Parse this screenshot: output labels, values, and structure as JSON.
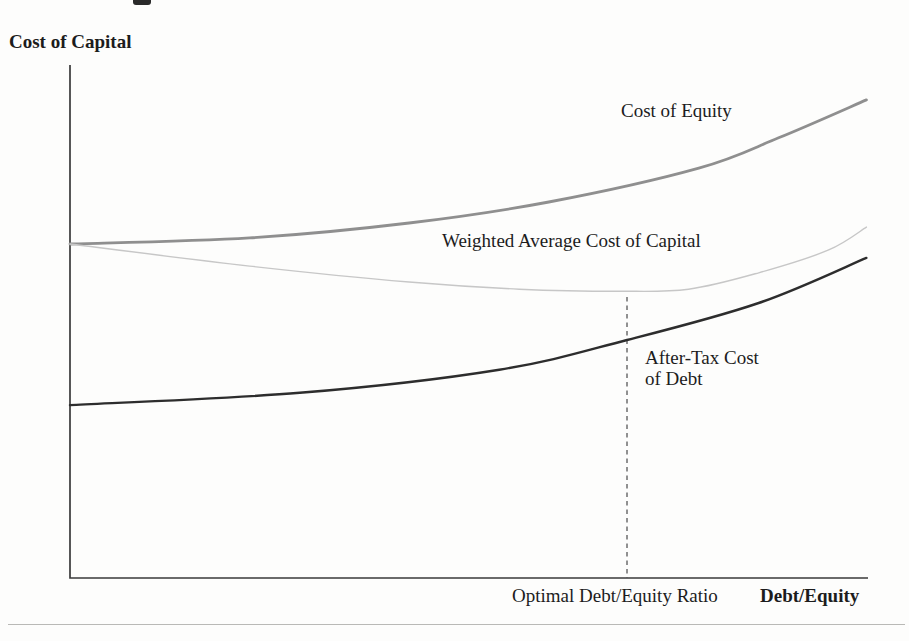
{
  "chart_data": {
    "type": "line",
    "title": "",
    "ylabel": "Cost of Capital",
    "xlabel": "Debt/Equity",
    "x_axis_annotation": "Optimal Debt/Equity Ratio",
    "axes": {
      "numeric_ticks": false,
      "grid": false,
      "note_units": "conceptual diagram, coordinates normalized 0-1 within plot box",
      "axis_color": "#3a3a3a"
    },
    "optimal_marker": {
      "x": 0.698,
      "y_top": 0.548,
      "style": "dashed-vertical",
      "color": "#4a4a4a"
    },
    "series": [
      {
        "name": "Cost of Equity",
        "color": "#8f8f8f",
        "stroke_width": 2.8,
        "points": [
          [
            0.0,
            0.651
          ],
          [
            0.225,
            0.663
          ],
          [
            0.425,
            0.692
          ],
          [
            0.6,
            0.733
          ],
          [
            0.788,
            0.799
          ],
          [
            0.888,
            0.858
          ],
          [
            0.998,
            0.932
          ]
        ]
      },
      {
        "name": "Weighted Average Cost of Capital",
        "color": "#c7c7c7",
        "stroke_width": 1.4,
        "points": [
          [
            0.0,
            0.651
          ],
          [
            0.225,
            0.608
          ],
          [
            0.425,
            0.577
          ],
          [
            0.563,
            0.563
          ],
          [
            0.688,
            0.559
          ],
          [
            0.775,
            0.563
          ],
          [
            0.863,
            0.595
          ],
          [
            0.95,
            0.639
          ],
          [
            0.998,
            0.684
          ]
        ]
      },
      {
        "name": "After-Tax Cost of Debt",
        "color": "#2d2d2d",
        "stroke_width": 2.4,
        "points": [
          [
            0.0,
            0.337
          ],
          [
            0.288,
            0.361
          ],
          [
            0.538,
            0.406
          ],
          [
            0.698,
            0.464
          ],
          [
            0.863,
            0.536
          ],
          [
            0.998,
            0.624
          ]
        ]
      }
    ]
  }
}
